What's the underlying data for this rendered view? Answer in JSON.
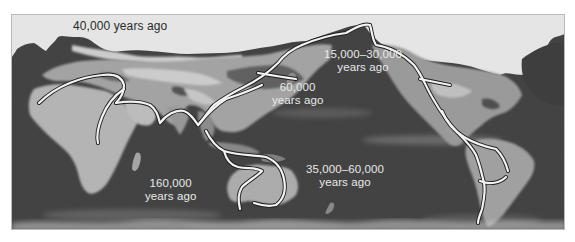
{
  "figure": {
    "type": "world-map",
    "style": "grayscale satellite map with white migration path lines",
    "colors": {
      "ocean": "#3a3a3a",
      "land_light": "#bdbdbd",
      "land_dark": "#8a8a8a",
      "ice": "#f4f4f4",
      "route_line": "#f2f2f2",
      "route_outline": "#222222",
      "label_text": "#e9e9e9",
      "label_text_on_ice": "#2a2a2a",
      "frame_border": "#b9b9b9"
    }
  },
  "labels": {
    "europe": {
      "line1": "40,000 years ago"
    },
    "asia": {
      "line1": "60,000",
      "line2": "years ago"
    },
    "beringia": {
      "line1": "15,000–30,000",
      "line2": "years ago"
    },
    "africa": {
      "line1": "160,000",
      "line2": "years ago"
    },
    "australia": {
      "line1": "35,000–60,000",
      "line2": "years ago"
    }
  },
  "routes": [
    {
      "name": "africa-to-europe",
      "period": "40,000 years ago"
    },
    {
      "name": "africa-origin",
      "period": "160,000 years ago"
    },
    {
      "name": "south-asia-coastal",
      "period": "60,000 years ago"
    },
    {
      "name": "east-asia-northward",
      "period": "60,000 years ago"
    },
    {
      "name": "southeast-asia-to-australia",
      "period": "35,000–60,000 years ago"
    },
    {
      "name": "beringia-to-north-america",
      "period": "15,000–30,000 years ago"
    },
    {
      "name": "pacific-coast-to-south-america",
      "period": "15,000–30,000 years ago"
    }
  ]
}
